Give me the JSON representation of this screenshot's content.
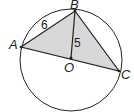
{
  "diagram": {
    "type": "geometry",
    "circle": {
      "center": "O",
      "cx": 71,
      "cy": 60,
      "r": 52
    },
    "points": {
      "A": {
        "label": "A",
        "x": 21,
        "y": 47
      },
      "B": {
        "label": "B",
        "x": 75,
        "y": 11
      },
      "C": {
        "label": "C",
        "x": 119,
        "y": 71
      },
      "O": {
        "label": "O",
        "x": 71,
        "y": 58
      }
    },
    "segments": [
      "AB",
      "BC",
      "AC",
      "BO"
    ],
    "shaded": "triangle ABC",
    "measures": {
      "AB": "6",
      "BO": "5"
    },
    "colors": {
      "stroke": "#222222",
      "fill": "#d8d8d8"
    }
  }
}
